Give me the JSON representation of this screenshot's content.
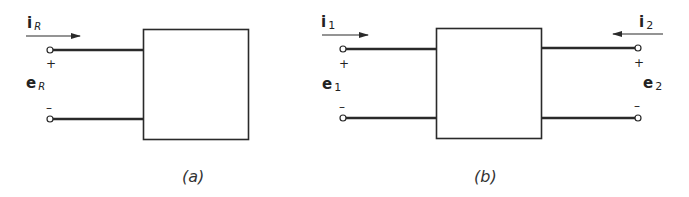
{
  "figure": {
    "panels": [
      {
        "id": "a",
        "caption": "(a)",
        "description": "One-port network",
        "ports": [
          {
            "side": "left",
            "current_label": "i",
            "current_sub": "R",
            "current_direction": "into-box",
            "voltage_label": "e",
            "voltage_sub": "R",
            "plus": "+",
            "minus": "–"
          }
        ]
      },
      {
        "id": "b",
        "caption": "(b)",
        "description": "Two-port network",
        "ports": [
          {
            "side": "left",
            "current_label": "i",
            "current_sub": "1",
            "current_direction": "into-box",
            "voltage_label": "e",
            "voltage_sub": "1",
            "plus": "+",
            "minus": "–"
          },
          {
            "side": "right",
            "current_label": "i",
            "current_sub": "2",
            "current_direction": "into-box",
            "voltage_label": "e",
            "voltage_sub": "2",
            "plus": "+",
            "minus": "–"
          }
        ]
      }
    ],
    "colors": {
      "line": "#2a2a2a",
      "background": "#ffffff"
    }
  }
}
